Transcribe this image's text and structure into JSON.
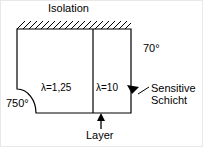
{
  "diagram": {
    "title_label": "Isolation",
    "labels": {
      "isolation": "Isolation",
      "temperature_right": "70°",
      "temperature_left": "750°",
      "lambda_left": "λ=1,25",
      "lambda_right": "λ=10",
      "sensitive_line1": "Sensitive",
      "sensitive_line2": "Schicht",
      "layer": "Layer"
    },
    "colors": {
      "stroke": "#000000",
      "background": "#ffffff",
      "border": "#e8e8e8"
    },
    "geometry": {
      "body_left": 16,
      "body_right": 130,
      "body_top": 28,
      "body_bottom": 112,
      "divider_x": 92,
      "fillet_start_y": 88,
      "fillet_end_x": 35,
      "hatch_spacing": 6,
      "hatch_height": 8
    }
  }
}
